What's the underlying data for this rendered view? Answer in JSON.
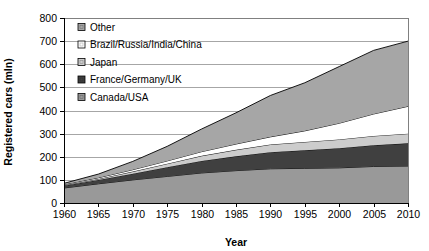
{
  "chart_data": {
    "type": "area",
    "title": "",
    "xlabel": "Year",
    "ylabel": "Registered cars (mln)",
    "xlim": [
      1960,
      2010
    ],
    "ylim": [
      0,
      800
    ],
    "grid": true,
    "stacked": true,
    "legend_position": "top-left-inside",
    "x": [
      1960,
      1965,
      1970,
      1975,
      1980,
      1985,
      1990,
      1995,
      2000,
      2005,
      2010
    ],
    "xticks": [
      "1960",
      "1965",
      "1970",
      "1975",
      "1980",
      "1985",
      "1990",
      "1995",
      "2000",
      "2005",
      "2010"
    ],
    "yticks": [
      "0",
      "100",
      "200",
      "300",
      "400",
      "500",
      "600",
      "700",
      "800"
    ],
    "series": [
      {
        "name": "Canada/USA",
        "color": "#999999",
        "values": [
          65,
          83,
          100,
          115,
          130,
          140,
          148,
          150,
          152,
          158,
          160
        ]
      },
      {
        "name": "France/Germany/UK",
        "color": "#404040",
        "values": [
          10,
          17,
          27,
          40,
          52,
          62,
          72,
          78,
          85,
          92,
          98
        ]
      },
      {
        "name": "Japan",
        "color": "#cccccc",
        "values": [
          2,
          4,
          9,
          15,
          22,
          28,
          33,
          36,
          38,
          40,
          42
        ]
      },
      {
        "name": "Brazil/Russia/India/China",
        "color": "#ffffff",
        "values": [
          3,
          5,
          8,
          12,
          18,
          25,
          33,
          48,
          70,
          95,
          118
        ]
      },
      {
        "name": "Other",
        "color": "#a6a6a6",
        "values": [
          5,
          16,
          36,
          63,
          98,
          135,
          179,
          208,
          245,
          275,
          282
        ]
      }
    ],
    "totals": [
      85,
      125,
      180,
      245,
      320,
      390,
      465,
      520,
      590,
      660,
      700
    ]
  },
  "legend": {
    "items": [
      {
        "label": "Other",
        "color": "#a6a6a6"
      },
      {
        "label": "Brazil/Russia/India/China",
        "color": "#ffffff"
      },
      {
        "label": "Japan",
        "color": "#cccccc"
      },
      {
        "label": "France/Germany/UK",
        "color": "#404040"
      },
      {
        "label": "Canada/USA",
        "color": "#999999"
      }
    ]
  },
  "axes": {
    "x_title": "Year",
    "y_title": "Registered cars (mln)"
  }
}
